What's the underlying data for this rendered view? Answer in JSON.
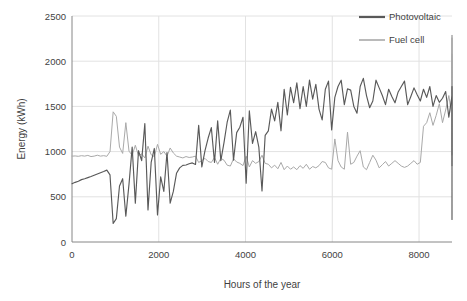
{
  "chart_data": {
    "type": "line",
    "title": "",
    "xlabel": "Hours of the year",
    "ylabel": "Energy (kWh)",
    "xlim": [
      0,
      8760
    ],
    "ylim": [
      0,
      2500
    ],
    "xticks": [
      0,
      2000,
      4000,
      6000,
      8000
    ],
    "xtick_labels": [
      "0",
      "2000",
      "4000",
      "6000",
      "8000"
    ],
    "yticks": [
      0,
      500,
      1000,
      1500,
      2000,
      2500
    ],
    "ytick_labels": [
      "0",
      "500",
      "1000",
      "1500",
      "2000",
      "2500"
    ],
    "grid": "horizontal-and-vertical-light",
    "legend_position": "top-right",
    "colors": {
      "photovoltaic": "#595959",
      "fuel_cell": "#a9a9a9",
      "grid": "#e2e2e2",
      "axis": "#868686",
      "text": "#3f3f3f",
      "background": "#ffffff"
    },
    "series": [
      {
        "name": "Photovoltaic",
        "color": "#595959",
        "x_step": 73,
        "values": [
          645,
          660,
          672,
          690,
          700,
          712,
          724,
          738,
          752,
          766,
          780,
          795,
          742,
          205,
          258,
          620,
          700,
          285,
          640,
          1050,
          430,
          1010,
          900,
          1310,
          355,
          880,
          1035,
          300,
          720,
          560,
          990,
          430,
          560,
          760,
          820,
          848,
          852,
          866,
          875,
          858,
          1290,
          830,
          1010,
          1150,
          1265,
          880,
          1340,
          900,
          1100,
          1325,
          1460,
          905,
          1210,
          1270,
          1380,
          650,
          1450,
          1090,
          1220,
          1050,
          565,
          1180,
          1230,
          1470,
          1340,
          1545,
          1230,
          1690,
          1405,
          1710,
          1540,
          1760,
          1475,
          1720,
          1500,
          1790,
          1580,
          1745,
          1470,
          1350,
          1690,
          1780,
          1240,
          1600,
          1720,
          1790,
          1520,
          1695,
          1680,
          1500,
          1425,
          1720,
          1810,
          1620,
          1485,
          1560,
          1790,
          1705,
          1620,
          1520,
          1690,
          1610,
          1540,
          1660,
          1720,
          1780,
          1520,
          1610,
          1705,
          1630,
          1560,
          1690,
          1600,
          1720,
          1500,
          1620,
          1545,
          1590,
          1665,
          1380,
          1620,
          1720,
          1440,
          1580,
          1665,
          1500,
          1600,
          1430,
          1545,
          1620,
          1450,
          1565,
          1380,
          1640,
          1560,
          1490,
          1620,
          1355,
          1580,
          1240,
          1460,
          1370,
          1570,
          1430,
          1610,
          1260,
          1520,
          1620,
          1400,
          1530,
          1360,
          1620,
          1300,
          1550,
          1200,
          1480,
          1370,
          1600,
          1180,
          1420,
          1480,
          1260,
          1540,
          1130,
          1440,
          1240,
          1520,
          1050,
          1380,
          1300,
          1460,
          980,
          1440,
          1250,
          1060,
          1380,
          860,
          1230,
          1410,
          760,
          1200,
          1000,
          1320,
          620,
          1120,
          900,
          1220,
          1105,
          820,
          1180,
          950,
          1080,
          1200,
          860,
          1090,
          1010,
          1180,
          970,
          790,
          1050,
          1080,
          955,
          640,
          1010,
          880,
          1130,
          960,
          375,
          880,
          1030,
          760,
          950,
          1000,
          900,
          830,
          960,
          880,
          940,
          900,
          870,
          860,
          850,
          830,
          845,
          810,
          820,
          790,
          760,
          810,
          640,
          770,
          720,
          690,
          730,
          620,
          710,
          580,
          660,
          700,
          560,
          640,
          690,
          600,
          660,
          480,
          620,
          545,
          700,
          510,
          660,
          420,
          590,
          640,
          480,
          610,
          545,
          700,
          480,
          620,
          560,
          275,
          610,
          650,
          420,
          540,
          600,
          250,
          560,
          660,
          520,
          445
        ]
      },
      {
        "name": "Fuel cell",
        "color": "#a9a9a9",
        "x_step": 73,
        "values": [
          950,
          952,
          948,
          955,
          950,
          958,
          945,
          950,
          960,
          950,
          955,
          948,
          1000,
          1440,
          1390,
          1050,
          980,
          1320,
          1005,
          960,
          1070,
          955,
          975,
          930,
          1060,
          965,
          945,
          1080,
          970,
          1000,
          950,
          1040,
          985,
          950,
          940,
          930,
          945,
          935,
          940,
          950,
          880,
          900,
          925,
          890,
          880,
          935,
          860,
          925,
          905,
          850,
          840,
          920,
          885,
          870,
          845,
          950,
          830,
          900,
          870,
          890,
          960,
          870,
          860,
          820,
          850,
          810,
          880,
          800,
          840,
          805,
          830,
          800,
          845,
          815,
          860,
          805,
          835,
          820,
          845,
          890,
          880,
          820,
          805,
          1140,
          900,
          830,
          805,
          1215,
          860,
          880,
          950,
          1010,
          830,
          800,
          880,
          960,
          905,
          820,
          855,
          890,
          840,
          870,
          900,
          870,
          840,
          825,
          840,
          870,
          900,
          860,
          880,
          1280,
          1320,
          1430,
          1290,
          1400,
          1530,
          1320,
          1460,
          1620,
          1385,
          1540,
          1680,
          1460,
          1600,
          2290,
          1630,
          1580,
          1720,
          1340,
          1660,
          1540,
          2260,
          1690,
          1780,
          1620,
          1900,
          1580,
          1760,
          1640,
          1820,
          1520,
          1730,
          1620,
          1850,
          1560,
          1700,
          1940,
          1650,
          1790,
          2040,
          1610,
          1750,
          1550,
          1830,
          2050,
          1620,
          1700,
          1880,
          1930,
          1640,
          1760,
          1520,
          1660,
          1450,
          1700,
          1560,
          1380,
          1620,
          1460,
          1700,
          2080,
          1540,
          1320,
          1640,
          1400,
          1520,
          1290,
          1600,
          1420,
          1240,
          1500,
          1340,
          1180,
          1450,
          1230,
          1320,
          1180,
          1400,
          1260,
          1130,
          1280,
          1170,
          1240,
          1120,
          1300,
          1160,
          1040,
          1200,
          1100,
          1440,
          1180,
          1090,
          1520,
          1150,
          1060,
          1200,
          2000,
          1140,
          1070,
          1150,
          1100,
          1050,
          1120,
          990,
          1060,
          1010,
          1040,
          980,
          1000,
          960,
          990,
          1000,
          970,
          980,
          960,
          1000,
          985,
          975,
          990,
          965,
          980,
          995,
          1000,
          1420,
          990,
          1010,
          980,
          1000,
          1410,
          985,
          1000,
          840,
          1010,
          990,
          1020,
          995,
          1000,
          1005,
          1010,
          980,
          1030
        ]
      }
    ]
  },
  "legend": {
    "items": [
      {
        "label": "Photovoltaic",
        "color": "#595959"
      },
      {
        "label": "Fuel cell",
        "color": "#a9a9a9"
      }
    ]
  },
  "axes": {
    "y_title": "Energy (kWh)",
    "x_title": "Hours of the year"
  }
}
